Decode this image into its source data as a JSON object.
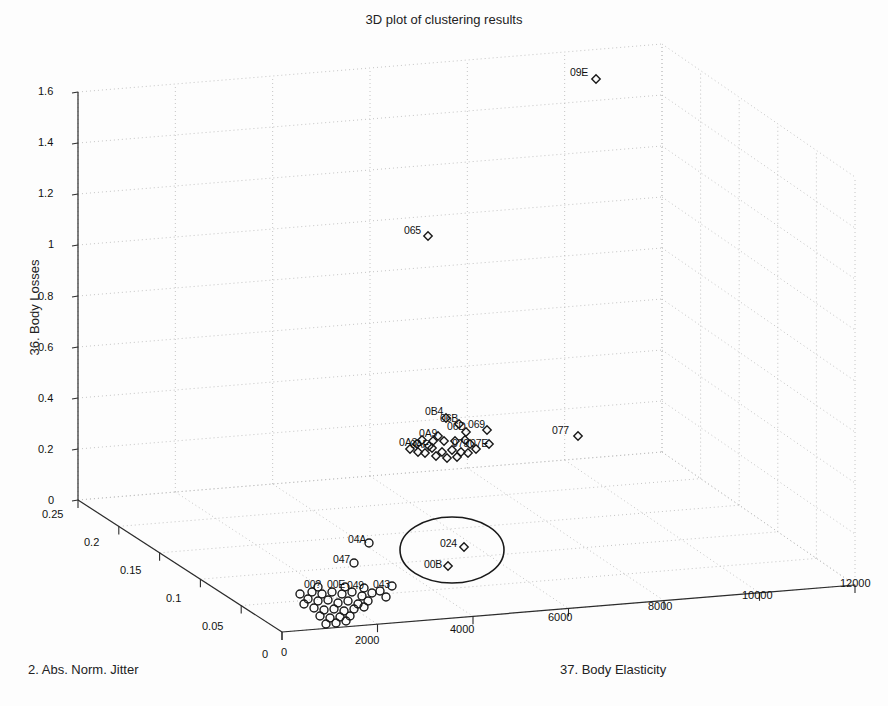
{
  "chart_data": {
    "type": "scatter",
    "title": "3D plot of clustering results",
    "xlabel": "37. Body Elasticity",
    "ylabel": "2. Abs. Norm. Jitter",
    "zlabel": "36. Body Losses",
    "grid": true,
    "legend": "none",
    "projection": "3d",
    "xlim": [
      0,
      12000
    ],
    "ylim": [
      0,
      0.25
    ],
    "zlim": [
      0,
      1.6
    ],
    "xticks": [
      "0",
      "2000",
      "4000",
      "6000",
      "8000",
      "10000",
      "12000"
    ],
    "xtick_values": [
      0,
      2000,
      4000,
      6000,
      8000,
      10000,
      12000
    ],
    "yticks": [
      "0",
      "0.05",
      "0.1",
      "0.15",
      "0.2",
      "0.25"
    ],
    "ytick_values": [
      0,
      0.05,
      0.1,
      0.15,
      0.2,
      0.25
    ],
    "zticks": [
      "0",
      "0.2",
      "0.4",
      "0.6",
      "0.8",
      "1",
      "1.2",
      "1.4",
      "1.6"
    ],
    "ztick_values": [
      0,
      0.2,
      0.4,
      0.6,
      0.8,
      1.0,
      1.2,
      1.4,
      1.6
    ],
    "annotations": [
      {
        "name": "highlight-ellipse",
        "shape": "ellipse",
        "cx": 452,
        "cy": 550,
        "rx": 52,
        "ry": 33
      }
    ],
    "series": [
      {
        "name": "cluster-diamond",
        "marker": "diamond",
        "color": "#1a1a1a",
        "points": [
          {
            "label": "09E",
            "px": 596,
            "py": 79,
            "lx": 570,
            "ly": 66
          },
          {
            "label": "065",
            "px": 428,
            "py": 236,
            "lx": 404,
            "ly": 224
          },
          {
            "label": "077",
            "px": 578,
            "py": 436,
            "lx": 552,
            "ly": 424
          },
          {
            "label": "0B4",
            "px": 446,
            "py": 418,
            "lx": 425,
            "ly": 405
          },
          {
            "label": "06B",
            "px": 459,
            "py": 424,
            "lx": 440,
            "ly": 412
          },
          {
            "label": "06D",
            "px": 466,
            "py": 432,
            "lx": 447,
            "ly": 420
          },
          {
            "label": "069",
            "px": 487,
            "py": 430,
            "lx": 468,
            "ly": 418
          },
          {
            "label": "0A9",
            "px": 438,
            "py": 436,
            "lx": 419,
            "ly": 427
          },
          {
            "label": "079",
            "px": 470,
            "py": 444,
            "lx": 452,
            "ly": 437
          },
          {
            "label": "07E",
            "px": 489,
            "py": 444,
            "lx": 470,
            "ly": 437
          },
          {
            "label": "0A3",
            "px": 417,
            "py": 444,
            "lx": 399,
            "ly": 436
          },
          {
            "label": "0AF",
            "px": 429,
            "py": 446,
            "lx": 410,
            "ly": 438
          },
          {
            "label": "024",
            "px": 464,
            "py": 547,
            "lx": 440,
            "ly": 537
          },
          {
            "label": "00B",
            "px": 448,
            "py": 566,
            "lx": 424,
            "ly": 558
          },
          {
            "label": "",
            "px": 432,
            "py": 448,
            "lx": 0,
            "ly": 0
          },
          {
            "label": "",
            "px": 442,
            "py": 452,
            "lx": 0,
            "ly": 0
          },
          {
            "label": "",
            "px": 452,
            "py": 450,
            "lx": 0,
            "ly": 0
          },
          {
            "label": "",
            "px": 461,
            "py": 452,
            "lx": 0,
            "ly": 0
          },
          {
            "label": "",
            "px": 425,
            "py": 453,
            "lx": 0,
            "ly": 0
          },
          {
            "label": "",
            "px": 436,
            "py": 456,
            "lx": 0,
            "ly": 0
          },
          {
            "label": "",
            "px": 447,
            "py": 458,
            "lx": 0,
            "ly": 0
          },
          {
            "label": "",
            "px": 457,
            "py": 457,
            "lx": 0,
            "ly": 0
          },
          {
            "label": "",
            "px": 468,
            "py": 453,
            "lx": 0,
            "ly": 0
          },
          {
            "label": "",
            "px": 418,
            "py": 452,
            "lx": 0,
            "ly": 0
          },
          {
            "label": "",
            "px": 410,
            "py": 449,
            "lx": 0,
            "ly": 0
          },
          {
            "label": "",
            "px": 476,
            "py": 449,
            "lx": 0,
            "ly": 0
          },
          {
            "label": "",
            "px": 455,
            "py": 441,
            "lx": 0,
            "ly": 0
          },
          {
            "label": "",
            "px": 444,
            "py": 441,
            "lx": 0,
            "ly": 0
          },
          {
            "label": "",
            "px": 465,
            "py": 440,
            "lx": 0,
            "ly": 0
          },
          {
            "label": "",
            "px": 433,
            "py": 441,
            "lx": 0,
            "ly": 0
          },
          {
            "label": "",
            "px": 422,
            "py": 440,
            "lx": 0,
            "ly": 0
          }
        ]
      },
      {
        "name": "cluster-circle",
        "marker": "circle",
        "color": "#1a1a1a",
        "points": [
          {
            "label": "04A",
            "px": 369,
            "py": 543,
            "lx": 348,
            "ly": 533
          },
          {
            "label": "047",
            "px": 354,
            "py": 563,
            "lx": 333,
            "ly": 553
          },
          {
            "label": "00E",
            "px": 345,
            "py": 587,
            "lx": 327,
            "ly": 578
          },
          {
            "label": "049",
            "px": 364,
            "py": 588,
            "lx": 347,
            "ly": 579
          },
          {
            "label": "043",
            "px": 392,
            "py": 586,
            "lx": 373,
            "ly": 578
          },
          {
            "label": "00?",
            "px": 318,
            "py": 587,
            "lx": 304,
            "ly": 578
          },
          {
            "label": "",
            "px": 312,
            "py": 592,
            "lx": 0,
            "ly": 0
          },
          {
            "label": "",
            "px": 322,
            "py": 594,
            "lx": 0,
            "ly": 0
          },
          {
            "label": "",
            "px": 332,
            "py": 592,
            "lx": 0,
            "ly": 0
          },
          {
            "label": "",
            "px": 342,
            "py": 594,
            "lx": 0,
            "ly": 0
          },
          {
            "label": "",
            "px": 352,
            "py": 592,
            "lx": 0,
            "ly": 0
          },
          {
            "label": "",
            "px": 362,
            "py": 596,
            "lx": 0,
            "ly": 0
          },
          {
            "label": "",
            "px": 372,
            "py": 593,
            "lx": 0,
            "ly": 0
          },
          {
            "label": "",
            "px": 308,
            "py": 599,
            "lx": 0,
            "ly": 0
          },
          {
            "label": "",
            "px": 318,
            "py": 601,
            "lx": 0,
            "ly": 0
          },
          {
            "label": "",
            "px": 328,
            "py": 600,
            "lx": 0,
            "ly": 0
          },
          {
            "label": "",
            "px": 338,
            "py": 603,
            "lx": 0,
            "ly": 0
          },
          {
            "label": "",
            "px": 348,
            "py": 601,
            "lx": 0,
            "ly": 0
          },
          {
            "label": "",
            "px": 358,
            "py": 604,
            "lx": 0,
            "ly": 0
          },
          {
            "label": "",
            "px": 368,
            "py": 601,
            "lx": 0,
            "ly": 0
          },
          {
            "label": "",
            "px": 314,
            "py": 608,
            "lx": 0,
            "ly": 0
          },
          {
            "label": "",
            "px": 324,
            "py": 610,
            "lx": 0,
            "ly": 0
          },
          {
            "label": "",
            "px": 334,
            "py": 609,
            "lx": 0,
            "ly": 0
          },
          {
            "label": "",
            "px": 344,
            "py": 611,
            "lx": 0,
            "ly": 0
          },
          {
            "label": "",
            "px": 354,
            "py": 609,
            "lx": 0,
            "ly": 0
          },
          {
            "label": "",
            "px": 364,
            "py": 607,
            "lx": 0,
            "ly": 0
          },
          {
            "label": "",
            "px": 320,
            "py": 616,
            "lx": 0,
            "ly": 0
          },
          {
            "label": "",
            "px": 330,
            "py": 618,
            "lx": 0,
            "ly": 0
          },
          {
            "label": "",
            "px": 340,
            "py": 617,
            "lx": 0,
            "ly": 0
          },
          {
            "label": "",
            "px": 350,
            "py": 616,
            "lx": 0,
            "ly": 0
          },
          {
            "label": "",
            "px": 326,
            "py": 624,
            "lx": 0,
            "ly": 0
          },
          {
            "label": "",
            "px": 336,
            "py": 623,
            "lx": 0,
            "ly": 0
          },
          {
            "label": "",
            "px": 346,
            "py": 621,
            "lx": 0,
            "ly": 0
          },
          {
            "label": "",
            "px": 300,
            "py": 594,
            "lx": 0,
            "ly": 0
          },
          {
            "label": "",
            "px": 304,
            "py": 604,
            "lx": 0,
            "ly": 0
          },
          {
            "label": "",
            "px": 380,
            "py": 591,
            "lx": 0,
            "ly": 0
          },
          {
            "label": "",
            "px": 386,
            "py": 597,
            "lx": 0,
            "ly": 0
          }
        ]
      }
    ]
  },
  "axes": {
    "z_ticks": [
      {
        "text": "1.6",
        "x": 38,
        "y": 85
      },
      {
        "text": "1.4",
        "x": 38,
        "y": 136
      },
      {
        "text": "1.2",
        "x": 38,
        "y": 187
      },
      {
        "text": "1",
        "x": 48,
        "y": 238
      },
      {
        "text": "0.8",
        "x": 38,
        "y": 290
      },
      {
        "text": "0.6",
        "x": 38,
        "y": 341
      },
      {
        "text": "0.4",
        "x": 38,
        "y": 392
      },
      {
        "text": "0.2",
        "x": 38,
        "y": 443
      },
      {
        "text": "0",
        "x": 48,
        "y": 494
      }
    ],
    "y_ticks": [
      {
        "text": "0.25",
        "x": 42,
        "y": 508
      },
      {
        "text": "0.2",
        "x": 84,
        "y": 536
      },
      {
        "text": "0.15",
        "x": 120,
        "y": 564
      },
      {
        "text": "0.1",
        "x": 166,
        "y": 592
      },
      {
        "text": "0.05",
        "x": 202,
        "y": 620
      },
      {
        "text": "0",
        "x": 262,
        "y": 648
      }
    ],
    "x_ticks": [
      {
        "text": "0",
        "x": 281,
        "y": 646
      },
      {
        "text": "2000",
        "x": 355,
        "y": 634
      },
      {
        "text": "4000",
        "x": 450,
        "y": 623
      },
      {
        "text": "6000",
        "x": 548,
        "y": 611
      },
      {
        "text": "8000",
        "x": 648,
        "y": 600
      },
      {
        "text": "10000",
        "x": 742,
        "y": 589
      },
      {
        "text": "12000",
        "x": 840,
        "y": 577
      }
    ]
  }
}
